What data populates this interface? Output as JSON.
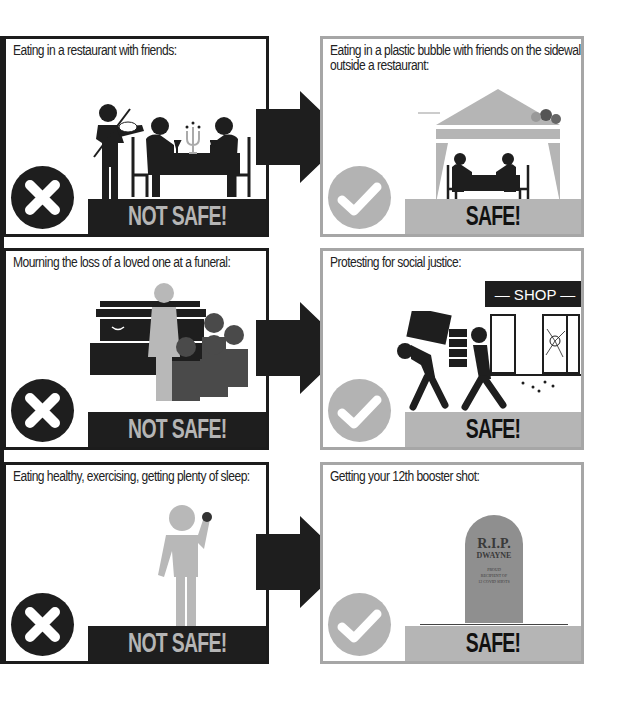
{
  "comparisons": [
    {
      "not_safe": {
        "caption": "Eating in a restaurant with friends:",
        "verdict": "NOT SAFE!",
        "icon": "x-icon",
        "illustration": "violinist-serenading-diners-at-candlelit-table"
      },
      "safe": {
        "caption": "Eating in a plastic bubble with friends on the sidewalk outside a restaurant:",
        "verdict": "SAFE!",
        "icon": "check-icon",
        "illustration": "diners-inside-tent-on-sidewalk-beside-trash"
      }
    },
    {
      "not_safe": {
        "caption": "Mourning the loss of a loved one at a funeral:",
        "verdict": "NOT SAFE!",
        "icon": "x-icon",
        "illustration": "mourners-beside-casket"
      },
      "safe": {
        "caption": "Protesting for social justice:",
        "verdict": "SAFE!",
        "icon": "check-icon",
        "illustration": "looters-carrying-goods-from-broken-shop",
        "shop_sign": "— SHOP —"
      }
    },
    {
      "not_safe": {
        "caption": "Eating healthy, exercising, getting plenty of sleep:",
        "verdict": "NOT SAFE!",
        "icon": "x-icon",
        "illustration": "person-holding-apple"
      },
      "safe": {
        "caption": "Getting your 12th booster shot:",
        "verdict": "SAFE!",
        "icon": "check-icon",
        "illustration": "tombstone",
        "tombstone": {
          "line1": "R.I.P.",
          "line2": "DWAYNE",
          "line3": "PROUD",
          "line4": "RECIPIENT OF",
          "line5": "12 COVID SHOTS"
        }
      }
    }
  ],
  "colors": {
    "dark": "#1e1e1e",
    "gray": "#b5b5b5",
    "light_gray_figure": "#b8b8b8",
    "mid_gray_figure": "#4a4a4a",
    "tombstone": "#8f8f8f"
  }
}
